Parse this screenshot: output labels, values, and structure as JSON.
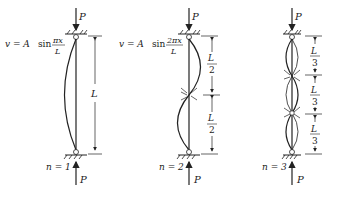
{
  "diagram": {
    "columns": [
      {
        "mode_label": "n = 1",
        "equation": {
          "lhs": "v = A",
          "fn": "sin",
          "num": "πx",
          "den": "L"
        },
        "load_label_top": "P",
        "load_label_bottom": "P",
        "dimensions": [
          {
            "num": "L",
            "den": ""
          }
        ]
      },
      {
        "mode_label": "n = 2",
        "equation": {
          "lhs": "v = A",
          "fn": "sin",
          "num": "2πx",
          "den": "L"
        },
        "load_label_top": "P",
        "load_label_bottom": "P",
        "dimensions": [
          {
            "num": "L",
            "den": "2"
          },
          {
            "num": "L",
            "den": "2"
          }
        ]
      },
      {
        "mode_label": "n = 3",
        "equation": null,
        "load_label_top": "P",
        "load_label_bottom": "P",
        "dimensions": [
          {
            "num": "L",
            "den": "3"
          },
          {
            "num": "L",
            "den": "3"
          },
          {
            "num": "L",
            "den": "3"
          }
        ]
      }
    ]
  }
}
